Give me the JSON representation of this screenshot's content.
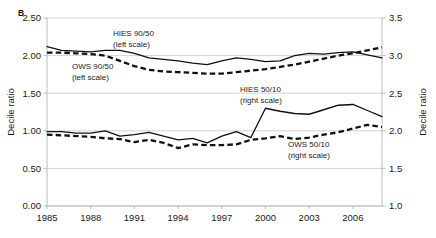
{
  "figure": {
    "panel_label": "B",
    "left_axis_title": "Decile ratio",
    "right_axis_title": "Decile ratio"
  },
  "chart_data": {
    "type": "line",
    "title": "",
    "xlabel": "",
    "ylabel": "Decile ratio",
    "y2label": "Decile ratio",
    "xlim": [
      1985,
      2008
    ],
    "ylim": [
      0.0,
      2.5
    ],
    "y2lim": [
      1.0,
      3.5
    ],
    "grid": true,
    "legend_position": "inline-annotations",
    "x": [
      1985,
      1986,
      1987,
      1988,
      1989,
      1990,
      1991,
      1992,
      1993,
      1994,
      1995,
      1996,
      1997,
      1998,
      1999,
      2000,
      2001,
      2002,
      2003,
      2004,
      2005,
      2006,
      2007,
      2008
    ],
    "xticks": [
      1985,
      1988,
      1991,
      1994,
      1997,
      2000,
      2003,
      2006
    ],
    "xticklabels": [
      "1985",
      "1988",
      "1991",
      "1994",
      "1997",
      "2000",
      "2003",
      "2006"
    ],
    "yticks": [
      0.0,
      0.5,
      1.0,
      1.5,
      2.0,
      2.5
    ],
    "yticklabels": [
      "0.00",
      "0.50",
      "1.00",
      "1.50",
      "2.00",
      "2.50"
    ],
    "y2ticks": [
      1.0,
      1.5,
      2.0,
      2.5,
      3.0,
      3.5
    ],
    "y2ticklabels": [
      "1.0",
      "1.5",
      "2.0",
      "2.5",
      "3.0",
      "3.5"
    ],
    "series": [
      {
        "name": "HIES 90/50",
        "axis": "left",
        "style": "solid",
        "annotation": "HIES 90/50",
        "annotation_sub": "(left scale)",
        "values": [
          2.12,
          2.07,
          2.06,
          2.05,
          2.07,
          2.07,
          2.03,
          1.97,
          1.95,
          1.93,
          1.9,
          1.88,
          1.93,
          1.97,
          1.95,
          1.92,
          1.93,
          2.0,
          2.03,
          2.02,
          2.04,
          2.05,
          2.01,
          1.97
        ]
      },
      {
        "name": "OWS 90/50",
        "axis": "left",
        "style": "dashed",
        "annotation": "OWS 90/50",
        "annotation_sub": "(left scale)",
        "values": [
          2.04,
          2.04,
          2.03,
          2.02,
          2.0,
          1.93,
          1.86,
          1.81,
          1.79,
          1.78,
          1.77,
          1.76,
          1.76,
          1.78,
          1.8,
          1.82,
          1.85,
          1.88,
          1.92,
          1.96,
          2.0,
          2.03,
          2.07,
          2.11
        ]
      },
      {
        "name": "HIES 50/10",
        "axis": "right",
        "style": "solid",
        "annotation": "HIES 50/10",
        "annotation_sub": "(right scale)",
        "values": [
          1.99,
          1.99,
          1.97,
          1.97,
          2.0,
          1.93,
          1.95,
          1.98,
          1.93,
          1.88,
          1.9,
          1.84,
          1.93,
          1.99,
          1.91,
          2.3,
          2.26,
          2.23,
          2.22,
          2.28,
          2.34,
          2.35,
          2.27,
          2.19
        ]
      },
      {
        "name": "OWS 50/10",
        "axis": "right",
        "style": "dashed",
        "annotation": "OWS 50/10",
        "annotation_sub": "(right scale)",
        "values": [
          1.95,
          1.94,
          1.93,
          1.92,
          1.9,
          1.89,
          1.85,
          1.88,
          1.84,
          1.77,
          1.82,
          1.81,
          1.81,
          1.82,
          1.88,
          1.9,
          1.93,
          1.89,
          1.91,
          1.95,
          1.98,
          2.03,
          2.08,
          2.05
        ]
      }
    ],
    "annotations": [
      {
        "text": "HIES 90/50",
        "sub": "(left scale)",
        "x": 113,
        "y": 36
      },
      {
        "text": "OWS 90/50",
        "sub": "(left scale)",
        "x": 72,
        "y": 69
      },
      {
        "text": "HIES 50/10",
        "sub": "(right scale)",
        "x": 240,
        "y": 92
      },
      {
        "text": "OWS 50/10",
        "sub": "(right scale)",
        "x": 288,
        "y": 147
      }
    ]
  }
}
